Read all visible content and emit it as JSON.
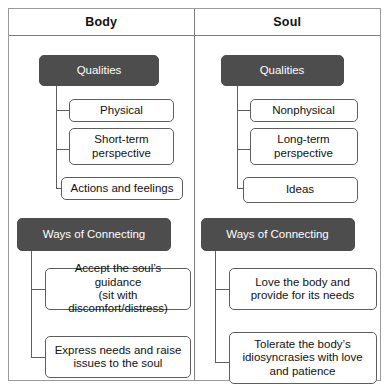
{
  "diagram": {
    "colors": {
      "dark_box": "#4d4d4d",
      "box_border": "#5e5e5e",
      "frame": "#9a9a9a",
      "text": "#111111",
      "dark_box_text": "#ffffff"
    },
    "headers": {
      "left": "Body",
      "right": "Soul"
    },
    "columns": [
      {
        "name": "body",
        "groups": [
          {
            "heading": "Qualities",
            "items": [
              "Physical",
              "Short-term perspective",
              "Actions and feelings"
            ]
          },
          {
            "heading": "Ways of Connecting",
            "items": [
              "Accept the soul's guidance (sit with discomfort/distress)",
              "Express needs and raise issues to the soul"
            ]
          }
        ]
      },
      {
        "name": "soul",
        "groups": [
          {
            "heading": "Qualities",
            "items": [
              "Nonphysical",
              "Long-term perspective",
              "Ideas"
            ]
          },
          {
            "heading": "Ways of Connecting",
            "items": [
              "Love the body and provide for its needs",
              "Tolerate the body's idiosyncrasies with love and patience"
            ]
          }
        ]
      }
    ],
    "body": {
      "qualities_heading": "Qualities",
      "q1": "Physical",
      "q2_line1": "Short-term",
      "q2_line2": "perspective",
      "q3": "Actions and feelings",
      "ways_heading": "Ways of Connecting",
      "w1_line1": "Accept the soul’s guidance",
      "w1_line2": "(sit with discomfort/distress)",
      "w2_line1": "Express needs and raise",
      "w2_line2": "issues to the soul"
    },
    "soul": {
      "qualities_heading": "Qualities",
      "q1": "Nonphysical",
      "q2_line1": "Long-term",
      "q2_line2": "perspective",
      "q3": "Ideas",
      "ways_heading": "Ways of Connecting",
      "w1_line1": "Love the body and",
      "w1_line2": "provide for its needs",
      "w2_line1": "Tolerate the body’s",
      "w2_line2": "idiosyncrasies with love",
      "w2_line3": "and patience"
    }
  }
}
